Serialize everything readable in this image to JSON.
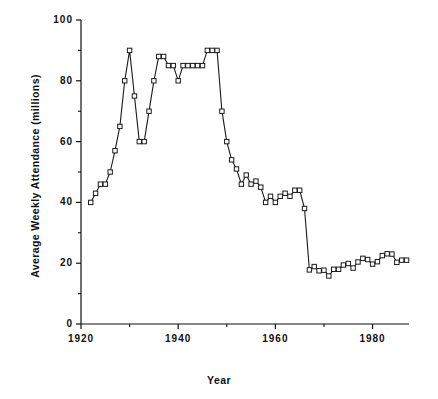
{
  "chart_data": {
    "type": "line",
    "title": "",
    "xlabel": "Year",
    "ylabel": "Average Weekly Attendance (millions)",
    "xlim": [
      1920,
      1987.5
    ],
    "ylim": [
      0,
      100
    ],
    "xticks": [
      1920,
      1940,
      1960,
      1980
    ],
    "xticks_minor": [
      1930,
      1950,
      1970
    ],
    "yticks": [
      0,
      20,
      40,
      60,
      80,
      100
    ],
    "yticks_minor": [
      10,
      30,
      50,
      70,
      90
    ],
    "xtick_labels": [
      "1920",
      "1940",
      "1960",
      "1980"
    ],
    "ytick_labels": [
      "0",
      "20",
      "40",
      "60",
      "80",
      "100"
    ],
    "grid": false,
    "legend": false,
    "marker": "open-square",
    "line_color": "#000000",
    "marker_fill": "#ffffff",
    "series": [
      {
        "name": "Average Weekly Attendance",
        "x": [
          1922,
          1923,
          1924,
          1925,
          1926,
          1927,
          1928,
          1929,
          1930,
          1931,
          1932,
          1933,
          1934,
          1935,
          1936,
          1937,
          1938,
          1939,
          1940,
          1941,
          1942,
          1943,
          1944,
          1945,
          1946,
          1947,
          1948,
          1949,
          1950,
          1951,
          1952,
          1953,
          1954,
          1955,
          1956,
          1957,
          1958,
          1959,
          1960,
          1961,
          1962,
          1963,
          1964,
          1965,
          1966,
          1967,
          1968,
          1969,
          1970,
          1971,
          1972,
          1973,
          1974,
          1975,
          1976,
          1977,
          1978,
          1979,
          1980,
          1981,
          1982,
          1983,
          1984,
          1985,
          1986,
          1987
        ],
        "values": [
          40,
          43,
          46,
          46,
          50,
          57,
          65,
          80,
          90,
          75,
          60,
          60,
          70,
          80,
          88,
          88,
          85,
          85,
          80,
          85,
          85,
          85,
          85,
          85,
          90,
          90,
          90,
          70,
          60,
          54,
          51,
          46,
          49,
          46,
          47,
          45,
          40,
          42,
          40,
          42,
          43,
          42,
          44,
          44,
          38,
          17.8,
          18.9,
          17.5,
          17.7,
          15.8,
          18.0,
          18.0,
          19.4,
          19.9,
          18.4,
          20.4,
          21.6,
          21.2,
          19.7,
          20.5,
          22.5,
          23.1,
          23.0,
          20.3,
          21.0,
          21.0
        ]
      }
    ],
    "note": "US motion picture average weekly attendance, 1922-1987"
  },
  "axes": {
    "x_title": "Year",
    "y_title": "Average Weekly Attendance (millions)"
  }
}
